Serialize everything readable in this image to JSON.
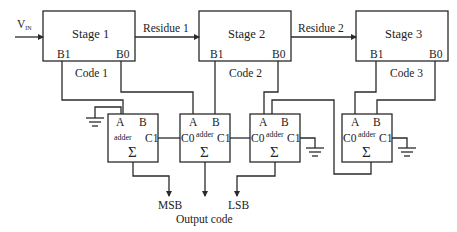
{
  "diagram": {
    "input": {
      "label": "V",
      "subscript": "IN"
    },
    "stages": [
      {
        "id": "stage-1",
        "title": "Stage 1",
        "ports": [
          "B1",
          "B0"
        ],
        "code": "Code 1"
      },
      {
        "id": "stage-2",
        "title": "Stage 2",
        "ports": [
          "B1",
          "B0"
        ],
        "code": "Code 2"
      },
      {
        "id": "stage-3",
        "title": "Stage 3",
        "ports": [
          "B1",
          "B0"
        ],
        "code": "Code 3"
      }
    ],
    "residues": [
      "Residue 1",
      "Residue 2"
    ],
    "adders": [
      {
        "id": "adder-1",
        "label": "adder",
        "in_a": "A",
        "in_b": "B",
        "carry_in": "",
        "carry_out": "C1",
        "sum": "Σ"
      },
      {
        "id": "adder-2",
        "label": "adder",
        "in_a": "A",
        "in_b": "B",
        "carry_in": "C0",
        "carry_out": "C1",
        "sum": "Σ"
      },
      {
        "id": "adder-3",
        "label": "adder",
        "in_a": "A",
        "in_b": "B",
        "carry_in": "C0",
        "carry_out": "C1",
        "sum": "Σ"
      },
      {
        "id": "adder-4",
        "label": "adder",
        "in_a": "A",
        "in_b": "B",
        "carry_in": "C0",
        "carry_out": "C1",
        "sum": "Σ"
      }
    ],
    "outputs": {
      "msb": "MSB",
      "lsb": "LSB",
      "caption": "Output code"
    }
  }
}
